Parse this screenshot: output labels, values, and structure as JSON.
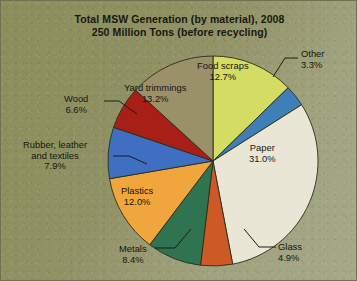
{
  "figure": {
    "title_line1": "Total MSW Generation (by material), 2008",
    "title_line2": "250 Million Tons (before recycling)"
  },
  "chart_data": {
    "type": "pie",
    "title": "Total MSW Generation (by material), 2008 250 Million Tons (before recycling)",
    "units": "percent of 250 Million Tons",
    "total_label": "250 Million Tons",
    "year": "2008",
    "legend": "none (direct slice labels)",
    "start_angle_deg": 0,
    "direction": "clockwise",
    "categories": [
      "Food scraps",
      "Other",
      "Paper",
      "Glass",
      "Metals",
      "Plastics",
      "Rubber, leather and textiles",
      "Wood",
      "Yard trimmings"
    ],
    "values": [
      12.7,
      3.3,
      31.0,
      4.9,
      8.4,
      12.0,
      7.9,
      6.6,
      13.2
    ],
    "value_labels": [
      "12.7%",
      "3.3%",
      "31.0%",
      "4.9%",
      "8.4%",
      "12.0%",
      "7.9%",
      "6.6%",
      "13.2%"
    ],
    "colors": [
      "#d5dc63",
      "#3f7fb8",
      "#e9e6d6",
      "#cc5a26",
      "#2f7350",
      "#f0a63c",
      "#3f6fc0",
      "#a81f18",
      "#9a9168"
    ],
    "slices": [
      {
        "name": "Food scraps",
        "label": "Food scraps",
        "value": 12.7,
        "value_label": "12.7%",
        "color": "#d5dc63",
        "label_placement": "inside",
        "leader": false
      },
      {
        "name": "Other",
        "label": "Other",
        "value": 3.3,
        "value_label": "3.3%",
        "color": "#3f7fb8",
        "label_placement": "outside",
        "leader": true
      },
      {
        "name": "Paper",
        "label": "Paper",
        "value": 31.0,
        "value_label": "31.0%",
        "color": "#e9e6d6",
        "label_placement": "inside",
        "leader": false
      },
      {
        "name": "Glass",
        "label": "Glass",
        "value": 4.9,
        "value_label": "4.9%",
        "color": "#cc5a26",
        "label_placement": "outside",
        "leader": true
      },
      {
        "name": "Metals",
        "label": "Metals",
        "value": 8.4,
        "value_label": "8.4%",
        "color": "#2f7350",
        "label_placement": "outside",
        "leader": true
      },
      {
        "name": "Plastics",
        "label": "Plastics",
        "value": 12.0,
        "value_label": "12.0%",
        "color": "#f0a63c",
        "label_placement": "inside",
        "leader": false
      },
      {
        "name": "Rubber, leather and textiles",
        "label": "Rubber, leather and textiles",
        "value": 7.9,
        "value_label": "7.9%",
        "color": "#3f6fc0",
        "label_placement": "outside",
        "leader": true
      },
      {
        "name": "Wood",
        "label": "Wood",
        "value": 6.6,
        "value_label": "6.6%",
        "color": "#a81f18",
        "label_placement": "outside",
        "leader": true
      },
      {
        "name": "Yard trimmings",
        "label": "Yard trimmings",
        "value": 13.2,
        "value_label": "13.2%",
        "color": "#9a9168",
        "label_placement": "inside",
        "leader": false
      }
    ]
  },
  "labels": {
    "other": {
      "name": "Other",
      "pct": "3.3%"
    },
    "paper": {
      "name": "Paper",
      "pct": "31.0%"
    },
    "glass": {
      "name": "Glass",
      "pct": "4.9%"
    },
    "metals": {
      "name": "Metals",
      "pct": "8.4%"
    },
    "plastics": {
      "name": "Plastics",
      "pct": "12.0%"
    },
    "rubber": {
      "name1": "Rubber, leather",
      "name2": "and textiles",
      "pct": "7.9%"
    },
    "wood": {
      "name": "Wood",
      "pct": "6.6%"
    },
    "yard": {
      "name": "Yard trimmings",
      "pct": "13.2%"
    },
    "food": {
      "name": "Food scraps",
      "pct": "12.7%"
    }
  },
  "style": {
    "background_dark": "#8d8e5c",
    "background_light": "#a5a988",
    "text_color": "#15160e",
    "slice_outline": "#2b2c1c"
  }
}
